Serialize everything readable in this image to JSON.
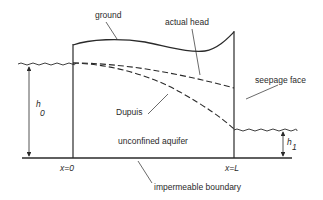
{
  "figure": {
    "type": "unconfined aquifer cross-section schematic",
    "colors": {
      "line": "#2a2a2a",
      "background": "#ffffff"
    }
  },
  "labels": {
    "ground": "ground",
    "actual_head": "actual head",
    "seepage_face": "seepage face",
    "dupuis": "Dupuis",
    "unconfined_aquifer": "unconfined aquifer",
    "impermeable_boundary": "impermeable boundary",
    "x0": "x=0",
    "xL": "x=L",
    "h0_main": "h",
    "h0_sub": "0",
    "h1_main": "h",
    "h1_sub": "1"
  },
  "curves": {
    "ground": "solid curve across aquifer top",
    "actual_head": "dashed, shallow decline from h0 to seepage face",
    "dupuis": "dashed, steeper parabola from h0 to h1"
  }
}
